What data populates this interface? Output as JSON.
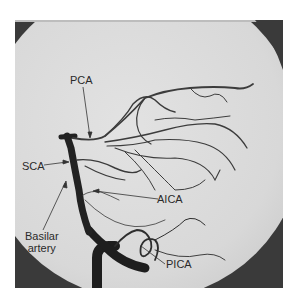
{
  "figure": {
    "labels": {
      "pca": "PCA",
      "sca": "SCA",
      "aica": "AICA",
      "basilar_line1": "Basilar",
      "basilar_line2": "artery",
      "pica": "PICA"
    },
    "colors": {
      "background_field": "#dcdcdc",
      "outer_mask": "#3a3a3a",
      "vessel": "#2a2a2a",
      "label_text": "#2a2a2a"
    }
  }
}
